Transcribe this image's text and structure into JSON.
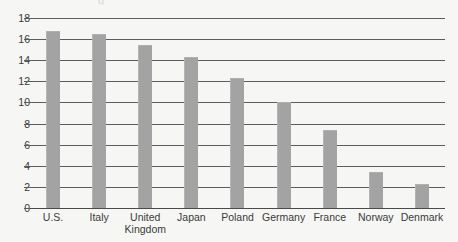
{
  "chart_data": {
    "type": "bar",
    "title": "",
    "xlabel": "",
    "ylabel": "",
    "ylim": [
      0,
      18
    ],
    "ytick_step": 2,
    "grid": true,
    "legend": false,
    "categories": [
      "U.S.",
      "Italy",
      "United\nKingdom",
      "Japan",
      "Poland",
      "Germany",
      "France",
      "Norway",
      "Denmark"
    ],
    "values": [
      16.8,
      16.5,
      15.4,
      14.3,
      12.3,
      10.0,
      7.4,
      3.4,
      2.3
    ],
    "ytick_labels": [
      "0",
      "2",
      "4",
      "6",
      "8",
      "10",
      "12",
      "14",
      "16",
      "18"
    ],
    "ytick_values": [
      0,
      2,
      4,
      6,
      8,
      10,
      12,
      14,
      16,
      18
    ],
    "bar_color": "#a3a3a3",
    "gridline_color": "#5d5d5d",
    "background_color": "#f6f6f4",
    "text_color": "#3b3b3b"
  },
  "artifact": {
    "clipped_glyph": "g"
  }
}
